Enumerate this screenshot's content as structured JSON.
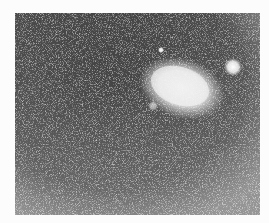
{
  "image": {
    "description": "Grainy monochrome astronomical photograph showing a bright diffuse elongated glow (comet or nebula) in upper right with a small star nearby, on a noisy dark background",
    "colors": {
      "background": "#4a4a4a",
      "glow": "#f2f2f2",
      "margin": "#fcfcfc"
    },
    "objects": [
      {
        "name": "main-glow",
        "cx": 167,
        "cy": 75,
        "rx": 36,
        "ry": 24,
        "rotation": 18
      },
      {
        "name": "star-right",
        "cx": 218,
        "cy": 54,
        "r": 7
      },
      {
        "name": "star-small",
        "cx": 146,
        "cy": 37,
        "r": 2
      },
      {
        "name": "faint-blob",
        "cx": 138,
        "cy": 93,
        "r": 4
      }
    ]
  }
}
